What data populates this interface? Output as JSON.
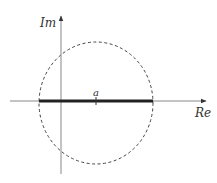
{
  "diagram": {
    "type": "complex-plane",
    "labels": {
      "imaginary_axis": "Im",
      "real_axis": "Re",
      "center_point": "a"
    },
    "colors": {
      "axis": "#888888",
      "segment": "#222222",
      "circle": "#444444",
      "text": "#333333"
    },
    "geometry": {
      "origin": [
        61,
        101
      ],
      "circle_center": [
        96,
        101
      ],
      "circle_radius_x": 57,
      "circle_radius_y": 60,
      "segment_from_x": 39,
      "segment_to_x": 153
    }
  }
}
